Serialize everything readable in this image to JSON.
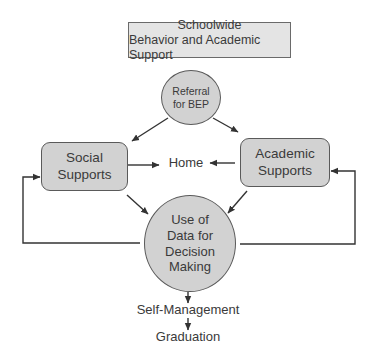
{
  "title": {
    "line1": "Schoolwide",
    "line2": "Behavior and Academic Support"
  },
  "nodes": {
    "referral": {
      "line1": "Referral",
      "line2": "for BEP"
    },
    "social": {
      "line1": "Social",
      "line2": "Supports"
    },
    "academic": {
      "line1": "Academic",
      "line2": "Supports"
    },
    "home": {
      "label": "Home"
    },
    "data": {
      "line1": "Use of",
      "line2": "Data for",
      "line3": "Decision",
      "line4": "Making"
    },
    "self_management": {
      "label": "Self-Management"
    },
    "graduation": {
      "label": "Graduation"
    }
  },
  "edges": [
    {
      "from": "Referral for BEP",
      "to": "Social Supports"
    },
    {
      "from": "Referral for BEP",
      "to": "Academic Supports"
    },
    {
      "from": "Social Supports",
      "to": "Home"
    },
    {
      "from": "Academic Supports",
      "to": "Home"
    },
    {
      "from": "Social Supports",
      "to": "Use of Data for Decision Making"
    },
    {
      "from": "Academic Supports",
      "to": "Use of Data for Decision Making"
    },
    {
      "from": "Use of Data for Decision Making",
      "to": "Social Supports",
      "type": "feedback-loop"
    },
    {
      "from": "Use of Data for Decision Making",
      "to": "Academic Supports",
      "type": "feedback-loop"
    },
    {
      "from": "Use of Data for Decision Making",
      "to": "Self-Management"
    },
    {
      "from": "Self-Management",
      "to": "Graduation"
    }
  ],
  "colors": {
    "node_fill": "#d2d2d2",
    "title_fill": "#e4e4e4",
    "stroke": "#3a3a3a"
  }
}
